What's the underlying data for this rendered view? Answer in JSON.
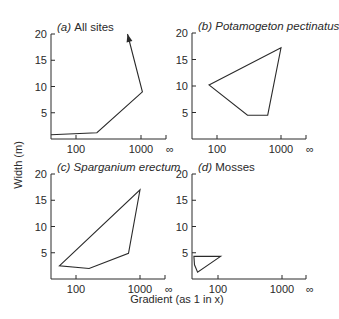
{
  "chart_data": [
    {
      "type": "line",
      "panel": "a",
      "label": "(a)",
      "title": "All sites",
      "title_italic": false,
      "xlabel": "Gradient (as 1 in x)",
      "ylabel": "Width (m)",
      "xscale": "log",
      "x_ticks": [
        "100",
        "1000",
        "∞"
      ],
      "y_ticks": [
        5,
        10,
        15,
        20
      ],
      "ylim": [
        0,
        20
      ],
      "shape": "polyline-with-arrow",
      "points": [
        [
          41,
          0.8
        ],
        [
          210,
          1.2
        ],
        [
          1050,
          9.0
        ],
        [
          620,
          20.0
        ]
      ]
    },
    {
      "type": "line",
      "panel": "b",
      "label": "(b)",
      "title": "Potamogeton pectinatus",
      "title_italic": true,
      "xscale": "log",
      "x_ticks": [
        "100",
        "1000",
        "∞"
      ],
      "y_ticks": [
        5,
        10,
        15,
        20
      ],
      "ylim": [
        0,
        20
      ],
      "shape": "polygon",
      "points": [
        [
          75,
          10.2
        ],
        [
          1000,
          17.2
        ],
        [
          620,
          4.5
        ],
        [
          300,
          4.5
        ]
      ]
    },
    {
      "type": "line",
      "panel": "c",
      "label": "(c)",
      "title": "Sparganium erectum",
      "title_italic": true,
      "xscale": "log",
      "x_ticks": [
        "100",
        "1000",
        "∞"
      ],
      "y_ticks": [
        5,
        10,
        15,
        20
      ],
      "ylim": [
        0,
        20
      ],
      "shape": "polygon",
      "points": [
        [
          55,
          2.5
        ],
        [
          1000,
          17.0
        ],
        [
          660,
          4.9
        ],
        [
          160,
          2.0
        ]
      ]
    },
    {
      "type": "line",
      "panel": "d",
      "label": "(d)",
      "title": "Mosses",
      "title_italic": false,
      "xscale": "log",
      "x_ticks": [
        "100",
        "1000",
        "∞"
      ],
      "y_ticks": [
        5,
        10,
        15,
        20
      ],
      "ylim": [
        0,
        20
      ],
      "shape": "polygon",
      "points": [
        [
          42,
          4.3
        ],
        [
          110,
          4.3
        ],
        [
          48,
          1.3
        ],
        [
          43,
          2.7
        ]
      ]
    }
  ],
  "figure": {
    "ylabel": "Width (m)",
    "xlabel": "Gradient (as 1 in x)"
  }
}
